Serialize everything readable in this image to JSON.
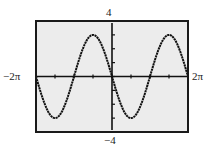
{
  "chart_data": {
    "type": "line",
    "title": "",
    "xlabel": "",
    "ylabel": "",
    "function": "y = -3 sin(x)",
    "xlim": [
      -6.2832,
      6.2832
    ],
    "ylim": [
      -4,
      4
    ],
    "x_tick_step": 1.5708,
    "y_tick_step": 1,
    "grid": false,
    "window_labels": {
      "xmin": "−2π",
      "xmax": "2π",
      "ymin": "−4",
      "ymax": "4"
    },
    "key_points": [
      {
        "x": "-2π",
        "y": 0
      },
      {
        "x": "-3π/2",
        "y": -3
      },
      {
        "x": "-π",
        "y": 0
      },
      {
        "x": "-π/2",
        "y": 3
      },
      {
        "x": "0",
        "y": 0
      },
      {
        "x": "π/2",
        "y": -3
      },
      {
        "x": "π",
        "y": 0
      },
      {
        "x": "3π/2",
        "y": 3
      },
      {
        "x": "2π",
        "y": 0
      }
    ],
    "series": [
      {
        "name": "y = -3 sin(x)",
        "amplitude": 3,
        "period": 6.2832,
        "sign": -1
      }
    ]
  },
  "colors": {
    "background": "#ffffff",
    "plot_background": "#ececec",
    "frame": "#1a1a1a",
    "curve": "#111111",
    "axis": "#111111"
  },
  "layout": {
    "box_left": 36,
    "box_top": 21,
    "box_right": 188,
    "box_bottom": 132
  }
}
